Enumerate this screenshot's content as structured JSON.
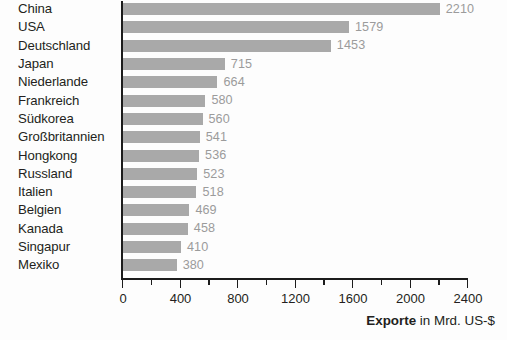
{
  "chart_data": {
    "type": "bar",
    "orientation": "horizontal",
    "title": "",
    "subtitle": "",
    "xlabel": "Exporte in Mrd. US-$",
    "xlabel_bold_part": "Exporte",
    "xlabel_rest_part": " in Mrd. US-$",
    "ylabel": "",
    "xlim": [
      0,
      2400
    ],
    "ylim": null,
    "grid": false,
    "legend": null,
    "bar_color": "#a9a9a9",
    "value_label_color": "#9b9b9b",
    "axis_color": "#1c1c1c",
    "text_color": "#231f20",
    "background_color": "#fdfdfd",
    "xticks_major": [
      0,
      400,
      800,
      1200,
      1600,
      2000,
      2400
    ],
    "xticks_major_labels": [
      "0",
      "400",
      "800",
      "1200",
      "1600",
      "2000",
      "2400"
    ],
    "xticks_minor": [
      200,
      600,
      1000,
      1400,
      1800,
      2200
    ],
    "categories": [
      "China",
      "USA",
      "Deutschland",
      "Japan",
      "Niederlande",
      "Frankreich",
      "Südkorea",
      "Großbritannien",
      "Hongkong",
      "Russland",
      "Italien",
      "Belgien",
      "Kanada",
      "Singapur",
      "Mexiko"
    ],
    "values": [
      2210,
      1579,
      1453,
      715,
      664,
      580,
      560,
      541,
      536,
      523,
      518,
      469,
      458,
      410,
      380
    ],
    "value_labels": [
      "2210",
      "1579",
      "1453",
      "715",
      "664",
      "580",
      "560",
      "541",
      "536",
      "523",
      "518",
      "469",
      "458",
      "410",
      "380"
    ],
    "series": [
      {
        "name": "Exporte",
        "unit": "Mrd. US-$",
        "values": [
          2210,
          1579,
          1453,
          715,
          664,
          580,
          560,
          541,
          536,
          523,
          518,
          469,
          458,
          410,
          380
        ]
      }
    ]
  }
}
